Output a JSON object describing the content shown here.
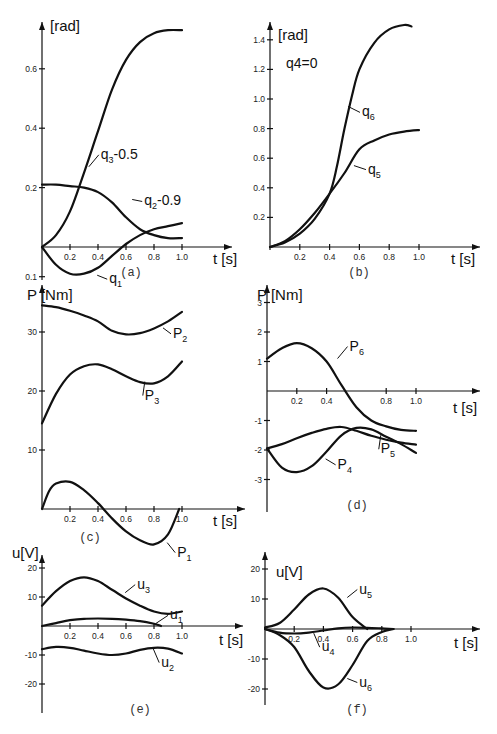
{
  "chart_data": [
    {
      "id": "a",
      "type": "line",
      "caption": "(a)",
      "ylabel": "[rad]",
      "xlabel": "t [s]",
      "x_ticks": [
        "0.2",
        "0.4",
        "0.6",
        "0.8",
        "1.0"
      ],
      "y_ticks": [
        "0.2",
        "0.4",
        "0.6"
      ],
      "y_ticks_negative": [
        "0.1"
      ],
      "xlim": [
        0,
        1.0
      ],
      "ylim": [
        -0.1,
        0.75
      ],
      "series": [
        {
          "name": "q3-0.5",
          "label": "q",
          "sub": "3",
          "suffix": "-0.5",
          "x": [
            0,
            0.1,
            0.2,
            0.3,
            0.4,
            0.5,
            0.6,
            0.7,
            0.8,
            0.9,
            1.0
          ],
          "y": [
            0,
            0.04,
            0.12,
            0.25,
            0.39,
            0.53,
            0.63,
            0.69,
            0.72,
            0.73,
            0.73
          ]
        },
        {
          "name": "q2-0.9",
          "label": "q",
          "sub": "2",
          "suffix": "-0.9",
          "x": [
            0,
            0.1,
            0.2,
            0.3,
            0.4,
            0.5,
            0.6,
            0.7,
            0.8,
            0.9,
            1.0
          ],
          "y": [
            0.21,
            0.21,
            0.205,
            0.2,
            0.185,
            0.15,
            0.1,
            0.06,
            0.04,
            0.03,
            0.03
          ]
        },
        {
          "name": "q1",
          "label": "q",
          "sub": "1",
          "suffix": "",
          "x": [
            0,
            0.1,
            0.2,
            0.3,
            0.4,
            0.5,
            0.6,
            0.7,
            0.8,
            0.9,
            1.0
          ],
          "y": [
            0,
            -0.06,
            -0.09,
            -0.09,
            -0.07,
            -0.03,
            0.01,
            0.04,
            0.06,
            0.07,
            0.08
          ]
        }
      ]
    },
    {
      "id": "b",
      "type": "line",
      "caption": "(b)",
      "ylabel": "[rad]",
      "annotation": "q4=0",
      "xlabel": "t [s]",
      "x_ticks": [
        "0.2",
        "0.4",
        "0.6",
        "0.8",
        "1.0"
      ],
      "y_ticks": [
        "0.2",
        "0.4",
        "0.6",
        "0.8",
        "1.0",
        "1.2",
        "1.4"
      ],
      "xlim": [
        0,
        1.0
      ],
      "ylim": [
        0,
        1.5
      ],
      "series": [
        {
          "name": "q6",
          "label": "q",
          "sub": "6",
          "suffix": "",
          "x": [
            0,
            0.1,
            0.2,
            0.3,
            0.4,
            0.45,
            0.5,
            0.55,
            0.6,
            0.7,
            0.8,
            0.9,
            0.95
          ],
          "y": [
            0,
            0.03,
            0.09,
            0.19,
            0.36,
            0.55,
            0.8,
            1.02,
            1.2,
            1.38,
            1.47,
            1.5,
            1.49
          ]
        },
        {
          "name": "q5",
          "label": "q",
          "sub": "5",
          "suffix": "",
          "x": [
            0,
            0.1,
            0.2,
            0.3,
            0.4,
            0.5,
            0.6,
            0.7,
            0.8,
            0.9,
            1.0
          ],
          "y": [
            0,
            0.04,
            0.12,
            0.23,
            0.36,
            0.5,
            0.66,
            0.72,
            0.76,
            0.78,
            0.79
          ]
        }
      ]
    },
    {
      "id": "c",
      "type": "line",
      "caption": "(c)",
      "ylabel": "P [Nm]",
      "xlabel": "t [s]",
      "x_ticks": [
        "0.2",
        "0.4",
        "0.6",
        "0.8",
        "1.0"
      ],
      "y_ticks": [
        "10",
        "20",
        "30"
      ],
      "xlim": [
        0,
        1.0
      ],
      "ylim": [
        -6,
        36
      ],
      "series": [
        {
          "name": "P2",
          "label": "P",
          "sub": "2",
          "suffix": "",
          "x": [
            0,
            0.1,
            0.2,
            0.3,
            0.4,
            0.5,
            0.6,
            0.7,
            0.8,
            0.9,
            1.0
          ],
          "y": [
            34.5,
            34.2,
            33.6,
            32.8,
            31.8,
            30.2,
            29.6,
            29.8,
            30.6,
            31.8,
            33.4
          ]
        },
        {
          "name": "P3",
          "label": "P",
          "sub": "3",
          "suffix": "",
          "x": [
            0,
            0.1,
            0.2,
            0.3,
            0.4,
            0.5,
            0.6,
            0.7,
            0.8,
            0.9,
            1.0
          ],
          "y": [
            14.5,
            19.5,
            22.8,
            24.2,
            24.5,
            23.7,
            22.5,
            21.5,
            21.3,
            22.5,
            25.0
          ]
        },
        {
          "name": "P1",
          "label": "P",
          "sub": "1",
          "suffix": "",
          "x": [
            0,
            0.05,
            0.1,
            0.2,
            0.3,
            0.4,
            0.5,
            0.6,
            0.7,
            0.8,
            0.9,
            0.98
          ],
          "y": [
            0,
            3.0,
            4.3,
            4.6,
            3.2,
            1.0,
            -1.6,
            -3.8,
            -5.3,
            -6.0,
            -4.3,
            0
          ]
        }
      ]
    },
    {
      "id": "d",
      "type": "line",
      "caption": "(d)",
      "ylabel": "P [Nm]",
      "xlabel": "t [s]",
      "x_ticks": [
        "0.2",
        "0.4",
        "0.8",
        "1.0"
      ],
      "y_ticks": [
        "1",
        "2",
        "3"
      ],
      "y_ticks_negative": [
        "-1",
        "-2",
        "-3"
      ],
      "xlim": [
        0,
        1.0
      ],
      "ylim": [
        -3,
        3.5
      ],
      "series": [
        {
          "name": "P6",
          "label": "P",
          "sub": "6",
          "suffix": "",
          "x": [
            0,
            0.1,
            0.2,
            0.3,
            0.4,
            0.5,
            0.6,
            0.7,
            0.8,
            0.9,
            1.0
          ],
          "y": [
            1.1,
            1.45,
            1.62,
            1.45,
            1.0,
            0.2,
            -0.55,
            -1.0,
            -1.2,
            -1.32,
            -1.35
          ]
        },
        {
          "name": "P5",
          "label": "P",
          "sub": "5",
          "suffix": "",
          "x": [
            0,
            0.1,
            0.2,
            0.3,
            0.4,
            0.5,
            0.6,
            0.7,
            0.8,
            0.9,
            1.0
          ],
          "y": [
            -1.95,
            -1.8,
            -1.6,
            -1.42,
            -1.28,
            -1.22,
            -1.35,
            -1.52,
            -1.65,
            -1.75,
            -1.82
          ]
        },
        {
          "name": "P4",
          "label": "P",
          "sub": "4",
          "suffix": "",
          "x": [
            0,
            0.1,
            0.2,
            0.3,
            0.4,
            0.5,
            0.6,
            0.7,
            0.8,
            0.9,
            1.0
          ],
          "y": [
            -1.95,
            -2.6,
            -2.75,
            -2.55,
            -2.05,
            -1.5,
            -1.25,
            -1.3,
            -1.55,
            -1.8,
            -2.1
          ]
        }
      ]
    },
    {
      "id": "e",
      "type": "line",
      "caption": "(e)",
      "ylabel": "u[V]",
      "xlabel": "t [s]",
      "x_ticks": [
        "0.2",
        "0.4",
        "0.6",
        "0.8",
        "1.0"
      ],
      "y_ticks": [
        "10",
        "20"
      ],
      "y_ticks_negative": [
        "-10",
        "-20"
      ],
      "xlim": [
        0,
        1.0
      ],
      "ylim": [
        -30,
        25
      ],
      "series": [
        {
          "name": "u3",
          "label": "u",
          "sub": "3",
          "suffix": "",
          "x": [
            0,
            0.1,
            0.2,
            0.3,
            0.4,
            0.5,
            0.6,
            0.7,
            0.8,
            0.9,
            1.0
          ],
          "y": [
            7,
            12,
            15.5,
            16.8,
            15.5,
            12.5,
            9.5,
            7.0,
            5.0,
            4.2,
            5.0
          ]
        },
        {
          "name": "u1",
          "label": "u",
          "sub": "1",
          "suffix": "",
          "x": [
            0,
            0.1,
            0.2,
            0.3,
            0.4,
            0.5,
            0.6,
            0.7,
            0.8,
            0.85
          ],
          "y": [
            0,
            1.0,
            2.0,
            2.5,
            2.6,
            2.5,
            2.2,
            1.7,
            0.8,
            0
          ]
        },
        {
          "name": "u2",
          "label": "u",
          "sub": "2",
          "suffix": "",
          "x": [
            0,
            0.1,
            0.2,
            0.3,
            0.4,
            0.5,
            0.6,
            0.7,
            0.8,
            0.9,
            1.0
          ],
          "y": [
            -8,
            -7.2,
            -7.5,
            -8.5,
            -9.5,
            -10.0,
            -9.5,
            -8.2,
            -7.5,
            -7.8,
            -9.5
          ]
        }
      ]
    },
    {
      "id": "f",
      "type": "line",
      "caption": "(f)",
      "ylabel": "u[V]",
      "xlabel": "t [s]",
      "x_ticks": [
        "0.2",
        "0.4",
        "0.6",
        "0.8",
        "1.0"
      ],
      "y_ticks": [
        "10",
        "20"
      ],
      "y_ticks_negative": [
        "-10",
        "-20"
      ],
      "xlim": [
        0,
        1.0
      ],
      "ylim": [
        -25,
        25
      ],
      "series": [
        {
          "name": "u5",
          "label": "u",
          "sub": "5",
          "suffix": "",
          "x": [
            0,
            0.1,
            0.2,
            0.3,
            0.4,
            0.5,
            0.6,
            0.7
          ],
          "y": [
            0.5,
            2.0,
            6.5,
            11.5,
            13.5,
            10.5,
            4.0,
            0
          ]
        },
        {
          "name": "u4",
          "label": "u",
          "sub": "4",
          "suffix": "",
          "x": [
            0,
            0.1,
            0.2,
            0.3,
            0.4,
            0.5,
            0.6,
            0.7,
            0.8,
            0.88
          ],
          "y": [
            0,
            -1.2,
            -1.5,
            -1.2,
            -0.5,
            0.2,
            0.5,
            0.4,
            0.2,
            0
          ]
        },
        {
          "name": "u6",
          "label": "u",
          "sub": "6",
          "suffix": "",
          "x": [
            0,
            0.1,
            0.2,
            0.3,
            0.4,
            0.5,
            0.6,
            0.7,
            0.8,
            0.88
          ],
          "y": [
            0,
            -2.0,
            -6.0,
            -14.0,
            -19.5,
            -18.5,
            -12.0,
            -4.0,
            -1.0,
            0
          ]
        }
      ]
    }
  ]
}
